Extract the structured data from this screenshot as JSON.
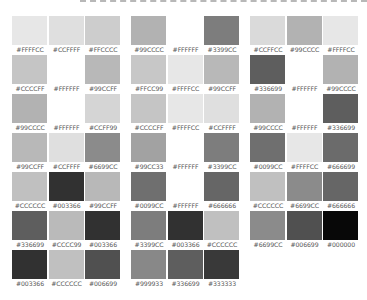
{
  "palette": {
    "groups": [
      {
        "rows": [
          [
            "#FFFFCC",
            "#CCFFFF",
            "#FFCCCC"
          ],
          [
            "#CCCCFF",
            "#FFFFFF",
            "#99CCFF"
          ],
          [
            "#99CCCC",
            "#FFFFFF",
            "#CCFF99"
          ],
          [
            "#99CCFF",
            "#CCFFFF",
            "#6699CC"
          ],
          [
            "#CCCCCC",
            "#003366",
            "#99CCFF"
          ],
          [
            "#336699",
            "#CCCC99",
            "#003366"
          ],
          [
            "#003366",
            "#CCCCCC",
            "#006699"
          ]
        ]
      },
      {
        "rows": [
          [
            "#99CCCC",
            "#FFFFFF",
            "#3399CC"
          ],
          [
            "#FFCC99",
            "#FFFFCC",
            "#99CCFF"
          ],
          [
            "#CCCCFF",
            "#FFFFCC",
            "#CCFFFF"
          ],
          [
            "#99CC33",
            "#FFFFFF",
            "#3399CC"
          ],
          [
            "#0099CC",
            "#FFFFFF",
            "#666666"
          ],
          [
            "#3399CC",
            "#003366",
            "#CCCCCC"
          ],
          [
            "#999933",
            "#336699",
            "#333333"
          ]
        ]
      },
      {
        "rows": [
          [
            "#CCFFCC",
            "#99CCCC",
            "#FFFFCC"
          ],
          [
            "#336699",
            "#FFFFFF",
            "#99CCCC"
          ],
          [
            "#99CCCC",
            "#FFFFFF",
            "#336699"
          ],
          [
            "#0099CC",
            "#FFFFCC",
            "#666699"
          ],
          [
            "#CCCCCC",
            "#6699CC",
            "#666666"
          ],
          [
            "#6699CC",
            "#006699",
            "#000000"
          ]
        ]
      }
    ]
  }
}
